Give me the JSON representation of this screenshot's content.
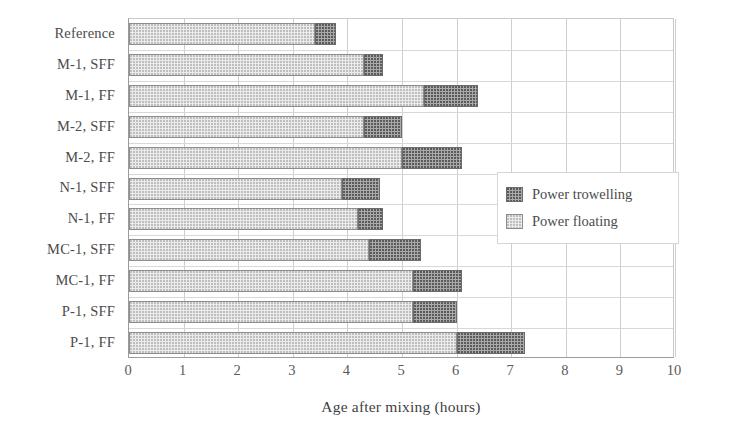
{
  "chart_data": {
    "type": "bar",
    "orientation": "horizontal",
    "stacked": true,
    "title": "",
    "xlabel": "Age after mixing (hours)",
    "ylabel": "",
    "xlim": [
      0,
      10
    ],
    "xticks": [
      0,
      1,
      2,
      3,
      4,
      5,
      6,
      7,
      8,
      9,
      10
    ],
    "xtick_labels": [
      "0",
      "1",
      "2",
      "3",
      "4",
      "5",
      "6",
      "7",
      "8",
      "9",
      "10"
    ],
    "grid": "vertical",
    "legend_position": "right-middle",
    "categories": [
      "Reference",
      "M-1, SFF",
      "M-1, FF",
      "M-2, SFF",
      "M-2, FF",
      "N-1, SFF",
      "N-1, FF",
      "MC-1, SFF",
      "MC-1, FF",
      "P-1, SFF",
      "P-1, FF"
    ],
    "series": [
      {
        "name": "Power floating",
        "color": "#ebebeb",
        "values": [
          3.4,
          4.3,
          5.4,
          4.3,
          5.0,
          3.9,
          4.2,
          4.4,
          5.2,
          5.2,
          6.0
        ]
      },
      {
        "name": "Power trowelling",
        "color": "#a9a9a9",
        "values": [
          0.4,
          0.35,
          1.0,
          0.7,
          1.1,
          0.7,
          0.45,
          0.95,
          0.9,
          0.8,
          1.25
        ]
      }
    ],
    "cumulative_ends": [
      3.8,
      4.65,
      6.4,
      5.0,
      6.1,
      4.6,
      4.65,
      5.35,
      6.1,
      6.0,
      7.25
    ]
  },
  "legend": {
    "entries": [
      {
        "label": "Power trowelling",
        "swatch": "dark-hatched-swatch"
      },
      {
        "label": "Power floating",
        "swatch": "light-dotted-swatch"
      }
    ]
  }
}
